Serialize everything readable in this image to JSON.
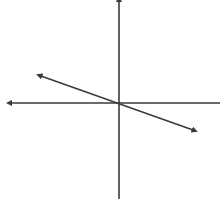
{
  "diagram": {
    "type": "coordinate-plane-line",
    "stroke_color": "#3a3a3a",
    "background": "#ffffff",
    "origin": {
      "x": 119,
      "y": 103
    },
    "x_axis": {
      "x1": 11,
      "y1": 103,
      "x2": 220,
      "y2": 103,
      "arrow_start": true,
      "arrow_end": false
    },
    "y_axis": {
      "x1": 119,
      "y1": 1,
      "x2": 119,
      "y2": 199,
      "arrow_start": true,
      "arrow_end": false
    },
    "line": {
      "x1": 41,
      "y1": 76,
      "x2": 193,
      "y2": 130,
      "arrow_start": true,
      "arrow_end": true,
      "slope_sign": "negative",
      "passes_through_origin": true
    }
  }
}
